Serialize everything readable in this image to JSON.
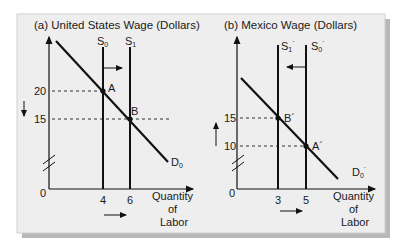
{
  "colors": {
    "panel_bg": "#eeeeee",
    "panel_border": "#cfcfcf",
    "shadow": "#b8b8b8",
    "ink": "#111111"
  },
  "panel_a": {
    "title": "(a) United States Wage (Dollars)",
    "y_ticks": [
      "20",
      "15"
    ],
    "origin": "0",
    "x_ticks": [
      "4",
      "6"
    ],
    "x_label_lines": [
      "Quantity",
      "of",
      "Labor"
    ],
    "supply_0": "S",
    "supply_0_sub": "0",
    "supply_1": "S",
    "supply_1_sub": "1",
    "demand": "D",
    "demand_sub": "0",
    "point_a": "A",
    "point_b": "B"
  },
  "panel_b": {
    "title": "(b) Mexico Wage (Dollars)",
    "y_ticks": [
      "15",
      "10"
    ],
    "origin": "0",
    "x_ticks": [
      "3",
      "5"
    ],
    "x_label_lines": [
      "Quantity",
      "of",
      "Labor"
    ],
    "supply_1": "S",
    "supply_1_sub": "1",
    "supply_0": "S",
    "supply_0_sub": "0",
    "prime": "´",
    "demand": "D",
    "demand_sub": "0",
    "point_b": "B´",
    "point_a": "A´"
  }
}
